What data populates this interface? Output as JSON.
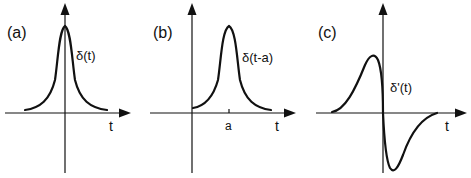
{
  "figure": {
    "panels": [
      {
        "id": "a",
        "panel_label": "(a)",
        "function_label": "δ(t)",
        "x_axis_label": "t",
        "tick_labels": []
      },
      {
        "id": "b",
        "panel_label": "(b)",
        "function_label": "δ(t-a)",
        "x_axis_label": "t",
        "tick_labels": [
          "a"
        ]
      },
      {
        "id": "c",
        "panel_label": "(c)",
        "function_label": "δ'(t)",
        "x_axis_label": "t",
        "tick_labels": []
      }
    ]
  },
  "colors": {
    "ink": "#111111",
    "background": "#ffffff"
  }
}
